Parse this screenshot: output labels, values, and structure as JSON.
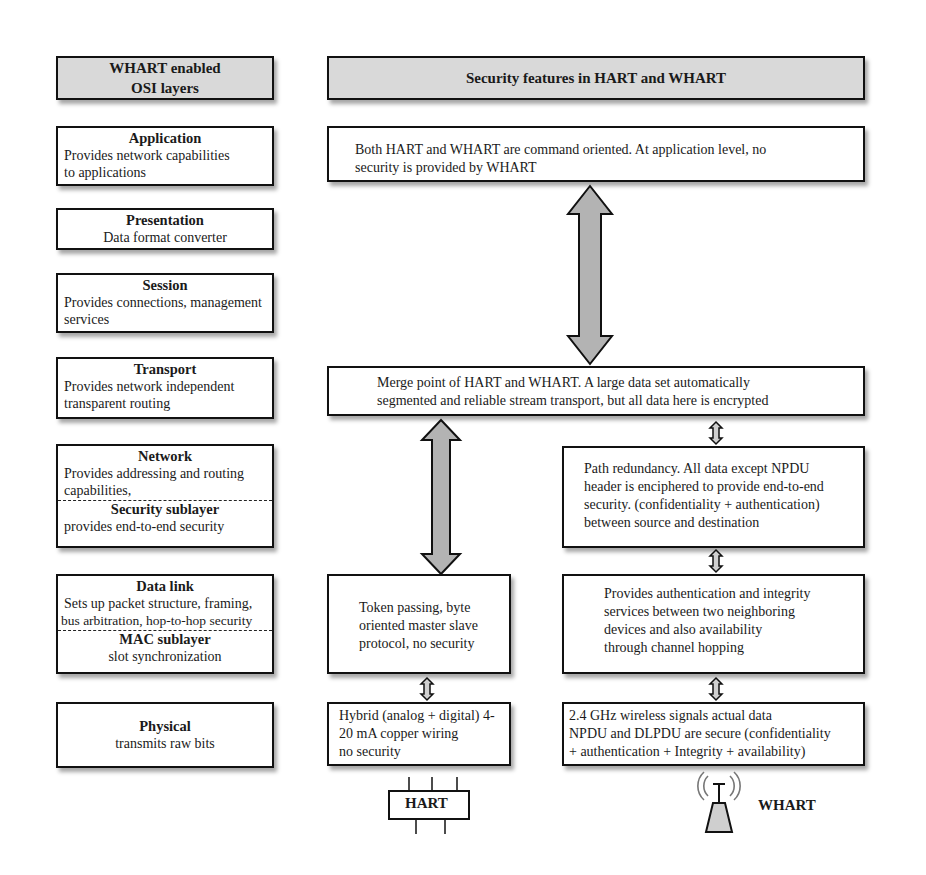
{
  "headers": {
    "left": [
      "WHART enabled",
      "OSI layers"
    ],
    "right": "Security features in HART and WHART"
  },
  "layers": [
    {
      "name": "Application",
      "desc": [
        "Provides network capabilities",
        "to applications"
      ]
    },
    {
      "name": "Presentation",
      "desc": [
        "Data format converter"
      ]
    },
    {
      "name": "Session",
      "desc": [
        "Provides connections, management",
        "services"
      ]
    },
    {
      "name": "Transport",
      "desc": [
        "Provides network independent",
        "transparent routing"
      ]
    },
    {
      "name": "Network",
      "desc": [
        "Provides addressing and routing",
        "capabilities,"
      ],
      "sublayer": {
        "name": "Security sublayer",
        "desc": "provides end-to-end security"
      }
    },
    {
      "name": "Data link",
      "desc": [
        "Sets up packet structure, framing,",
        "bus arbitration,  hop-to-hop  security"
      ],
      "sublayer": {
        "name": "MAC sublayer",
        "desc": "slot synchronization"
      }
    },
    {
      "name": "Physical",
      "desc": [
        "transmits raw bits"
      ]
    }
  ],
  "features": {
    "application": [
      "Both HART and WHART are command oriented.  At application  level, no",
      "security is provided by WHART"
    ],
    "transport": [
      "Merge point of HART and WHART. A large data set automatically",
      "segmented and reliable  stream  transport, but all data here is encrypted"
    ],
    "network_whart": [
      "Path redundancy. All data except NPDU",
      "header is enciphered to provide end-to-end",
      "security. (confidentiality  + authentication)",
      "between source and destination"
    ],
    "datalink_hart": [
      "Token passing, byte",
      "oriented master slave",
      "protocol, no security"
    ],
    "datalink_whart": [
      "Provides authentication  and integrity",
      "services between two neighboring",
      "devices and also availability",
      "through channel hopping"
    ],
    "physical_hart": [
      "Hybrid (analog + digital) 4-",
      "20 mA  copper wiring",
      "no security"
    ],
    "physical_whart": [
      "2.4 GHz wireless signals actual  data",
      "NPDU and DLPDU are secure (confidentiality",
      "+ authentication  + Integrity + availability)"
    ]
  },
  "icons": {
    "hart_label": "HART",
    "whart_label": "WHART"
  },
  "colors": {
    "header_fill": "#d9d9d9",
    "arrow_fill": "#b3b3b3",
    "border": "#111111"
  }
}
